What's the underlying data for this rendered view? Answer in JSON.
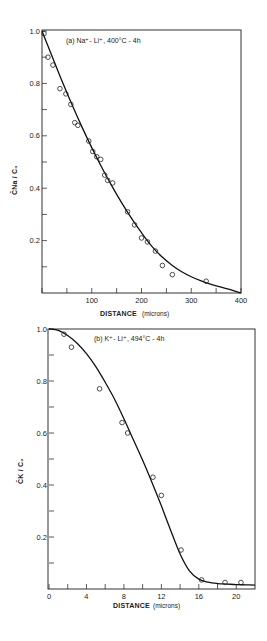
{
  "chart_data": [
    {
      "id": "a",
      "type": "scatter",
      "title": "(a) Na+ - Li+, 400°C - 4h",
      "annotation": "(a) Na⁺- Li⁺, 400°C - 4h",
      "xlabel": "DISTANCE",
      "xlabel_unit": "(microns)",
      "ylabel": "C̄Na / C₀",
      "xlim": [
        0,
        400
      ],
      "ylim": [
        0,
        1.0
      ],
      "x_ticks": [
        0,
        50,
        100,
        150,
        200,
        250,
        300,
        350,
        400
      ],
      "x_tick_labels": [
        "",
        "",
        "100",
        "",
        "200",
        "",
        "300",
        "",
        "400"
      ],
      "y_ticks": [
        0.1,
        0.2,
        0.3,
        0.4,
        0.5,
        0.6,
        0.7,
        0.8,
        0.9,
        1.0
      ],
      "y_tick_labels": [
        "",
        "0.2",
        "",
        "0.4",
        "",
        "0.6",
        "",
        "0.8",
        "",
        "1.0"
      ],
      "grid": false,
      "series": [
        {
          "name": "measured",
          "style": "open-circle",
          "x": [
            4,
            12,
            22,
            36,
            48,
            58,
            66,
            72,
            94,
            102,
            110,
            118,
            126,
            132,
            142,
            172,
            186,
            200,
            212,
            228,
            242,
            262,
            330
          ],
          "y": [
            0.99,
            0.9,
            0.87,
            0.78,
            0.76,
            0.72,
            0.65,
            0.64,
            0.58,
            0.54,
            0.52,
            0.51,
            0.45,
            0.43,
            0.42,
            0.31,
            0.26,
            0.21,
            0.195,
            0.16,
            0.105,
            0.07,
            0.045
          ]
        },
        {
          "name": "fit",
          "style": "solid-line",
          "x": [
            0,
            20,
            40,
            60,
            80,
            100,
            120,
            140,
            160,
            180,
            200,
            220,
            240,
            260,
            280,
            300,
            320,
            340,
            360,
            380,
            400
          ],
          "y": [
            1.0,
            0.905,
            0.81,
            0.72,
            0.635,
            0.555,
            0.48,
            0.41,
            0.345,
            0.285,
            0.23,
            0.18,
            0.14,
            0.108,
            0.082,
            0.062,
            0.046,
            0.033,
            0.022,
            0.012,
            0.0
          ]
        }
      ]
    },
    {
      "id": "b",
      "type": "scatter",
      "title": "(b) K+ - Li+, 494°C - 4h",
      "annotation": "(b) K⁺- Li⁺, 494°C - 4h",
      "xlabel": "DISTANCE",
      "xlabel_unit": "(microns)",
      "ylabel": "C̄K / C₀",
      "xlim": [
        0,
        22
      ],
      "ylim": [
        0,
        1.0
      ],
      "x_ticks": [
        0,
        2,
        4,
        6,
        8,
        10,
        12,
        14,
        16,
        18,
        20
      ],
      "x_tick_labels": [
        "0",
        "",
        "4",
        "",
        "8",
        "",
        "12",
        "",
        "16",
        "",
        "20"
      ],
      "y_ticks": [
        0.1,
        0.2,
        0.3,
        0.4,
        0.5,
        0.6,
        0.7,
        0.8,
        0.9,
        1.0
      ],
      "y_tick_labels": [
        "",
        "0.2",
        "",
        "0.4",
        "",
        "0.6",
        "",
        "0.8",
        "",
        "1.0"
      ],
      "grid": false,
      "series": [
        {
          "name": "measured",
          "style": "open-circle",
          "x": [
            1.6,
            2.4,
            5.4,
            7.8,
            8.4,
            11.1,
            12.0,
            14.1,
            16.3,
            18.8,
            20.5
          ],
          "y": [
            0.98,
            0.93,
            0.77,
            0.64,
            0.6,
            0.43,
            0.36,
            0.15,
            0.035,
            0.025,
            0.025
          ]
        },
        {
          "name": "fit",
          "style": "solid-line",
          "x": [
            0,
            1,
            2,
            3,
            4,
            5,
            6,
            7,
            8,
            9,
            10,
            11,
            12,
            13,
            14,
            15,
            16,
            17,
            18,
            19,
            20,
            21,
            22
          ],
          "y": [
            1.0,
            0.995,
            0.975,
            0.945,
            0.905,
            0.855,
            0.795,
            0.73,
            0.655,
            0.575,
            0.495,
            0.41,
            0.32,
            0.225,
            0.135,
            0.07,
            0.038,
            0.026,
            0.021,
            0.019,
            0.017,
            0.016,
            0.015
          ]
        }
      ]
    }
  ],
  "charts": {
    "a": {
      "annotation": "(a) Na⁺- Li⁺, 400°C - 4h",
      "ylabel": "C̄Na / C₀",
      "xlabel": "DISTANCE",
      "xlabel_unit": "(microns)",
      "x_tick_labels": [
        "100",
        "200",
        "300",
        "400"
      ],
      "y_tick_labels": [
        "0.2",
        "0.4",
        "0.6",
        "0.8",
        "1.0"
      ]
    },
    "b": {
      "annotation": "(b) K⁺- Li⁺, 494°C - 4h",
      "ylabel": "C̄K / C₀",
      "xlabel": "DISTANCE",
      "xlabel_unit": "(microns)",
      "x_tick_labels": [
        "0",
        "4",
        "8",
        "12",
        "16",
        "20"
      ],
      "y_tick_labels": [
        "0.2",
        "0.4",
        "0.6",
        "0.8",
        "1.0"
      ]
    }
  }
}
